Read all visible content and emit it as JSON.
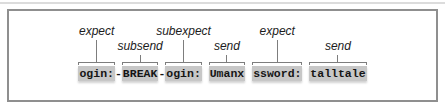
{
  "figure": {
    "full_text": "ogin:-BREAK-ogin: Umanx ssword: talltale",
    "frame_border_color": "#8f8f8f",
    "frame_background": "#ffffff"
  },
  "diagram": {
    "colors": {
      "highlight": "#c7c7c7",
      "line": "#7d7d7d",
      "token_text": "#151515",
      "label_text": "#1c1c1c"
    },
    "items": [
      {
        "type": "token",
        "text": "ogin:",
        "label": "expect",
        "label_row": "high"
      },
      {
        "type": "sep",
        "text": "-"
      },
      {
        "type": "token",
        "text": "BREAK",
        "label": "subsend",
        "label_row": "low"
      },
      {
        "type": "sep",
        "text": "-"
      },
      {
        "type": "token",
        "text": "ogin:",
        "label": "subexpect",
        "label_row": "high"
      },
      {
        "type": "sep",
        "text": " "
      },
      {
        "type": "token",
        "text": "Umanx",
        "label": "send",
        "label_row": "low"
      },
      {
        "type": "sep",
        "text": " "
      },
      {
        "type": "token",
        "text": "ssword:",
        "label": "expect",
        "label_row": "high"
      },
      {
        "type": "sep",
        "text": " "
      },
      {
        "type": "token",
        "text": "talltale",
        "label": "send",
        "label_row": "low"
      }
    ]
  }
}
